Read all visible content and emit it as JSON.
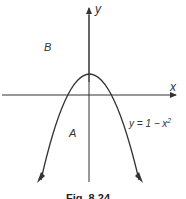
{
  "figure": {
    "caption": "Fig. 8.24",
    "axes": {
      "x_label": "x",
      "y_label": "y"
    },
    "regions": [
      {
        "label": "A"
      },
      {
        "label": "B"
      }
    ],
    "curve": {
      "equation_prefix": "y = 1 − x",
      "equation_exponent": "2"
    },
    "colors": {
      "stroke": "#333333",
      "background": "#ffffff"
    }
  }
}
